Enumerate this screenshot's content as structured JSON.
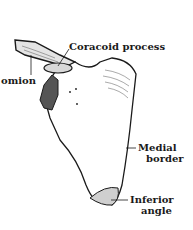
{
  "diagram": {
    "labels": {
      "coracoid": "Coracoid process",
      "acromion": "omion",
      "medial_1": "Medial",
      "medial_2": "border",
      "inferior_1": "Inferior",
      "inferior_2": "angle"
    },
    "colors": {
      "ink": "#1a1a1a",
      "shade": "#cfcfcf",
      "background": "#ffffff"
    }
  }
}
